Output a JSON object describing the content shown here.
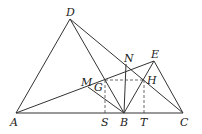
{
  "diagram": {
    "points": {
      "A": {
        "label": "A",
        "x": 16,
        "y": 113
      },
      "B": {
        "label": "B",
        "x": 124,
        "y": 113
      },
      "C": {
        "label": "C",
        "x": 183,
        "y": 113
      },
      "D": {
        "label": "D",
        "x": 70,
        "y": 19
      },
      "E": {
        "label": "E",
        "x": 154,
        "y": 61
      },
      "N": {
        "label": "N",
        "x": 127,
        "y": 67
      },
      "M": {
        "label": "M",
        "x": 88,
        "y": 87
      },
      "G": {
        "label": "G",
        "x": 105,
        "y": 80
      },
      "H": {
        "label": "H",
        "x": 144,
        "y": 80
      },
      "S": {
        "label": "S",
        "x": 105,
        "y": 113
      },
      "T": {
        "label": "T",
        "x": 144,
        "y": 113
      }
    },
    "segments": [
      "AC",
      "AD",
      "DB",
      "DC",
      "AE",
      "EC",
      "BE",
      "MB",
      "BN"
    ],
    "dashed_segments": [
      "GH",
      "GS",
      "HT"
    ]
  }
}
